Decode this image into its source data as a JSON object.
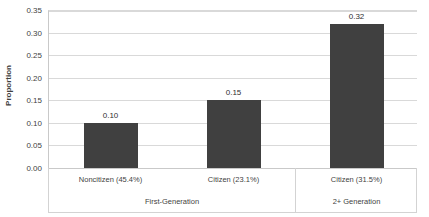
{
  "chart_data": {
    "type": "bar",
    "title": "",
    "xlabel": "",
    "ylabel": "Proportion",
    "ylim": [
      0.0,
      0.35
    ],
    "ytick_labels": [
      "0.35",
      "0.30",
      "0.25",
      "0.20",
      "0.15",
      "0.10",
      "0.05",
      "0.00"
    ],
    "ytick_values": [
      0.35,
      0.3,
      0.25,
      0.2,
      0.15,
      0.1,
      0.05,
      0.0
    ],
    "grid": true,
    "legend": "none",
    "categories": [
      "Noncitizen (45.4%)",
      "Citizen (23.1%)",
      "Citizen (31.5%)"
    ],
    "values": [
      0.1,
      0.15,
      0.32
    ],
    "value_labels": [
      "0.10",
      "0.15",
      "0.32"
    ],
    "bar_color": "#404040",
    "gridline_color": "#d9d9d9",
    "groups": [
      {
        "label": "First-Generation",
        "categories": [
          "Noncitizen (45.4%)",
          "Citizen (23.1%)"
        ]
      },
      {
        "label": "2+ Generation",
        "categories": [
          "Citizen (31.5%)"
        ]
      }
    ]
  }
}
